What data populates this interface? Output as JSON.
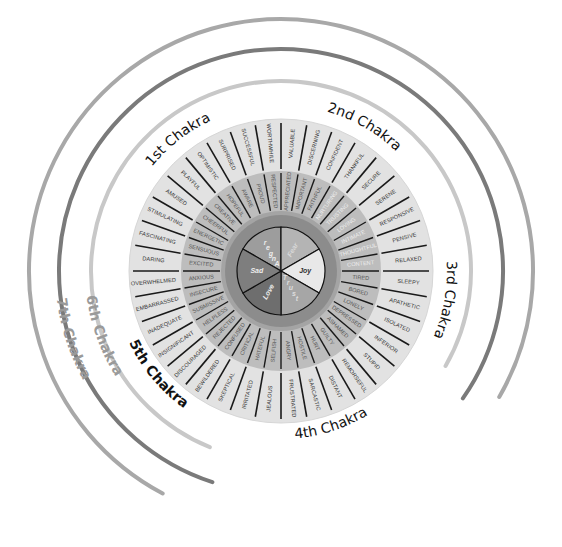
{
  "diagram": {
    "type": "emotion-wheel",
    "center": {
      "x": 281,
      "y": 271
    },
    "colors": {
      "background": "#ffffff",
      "outer_ring_fill": "#e2e2e2",
      "middle_ring_fill": "#bdbdbd",
      "core_fill": "#8c8c8c",
      "spoke": "#1a1a1a",
      "arc_light": "#c8c8c8",
      "arc_dark": "#7a7a7a",
      "arc_mid": "#a8a8a8"
    },
    "core_emotions": [
      {
        "label": "Anger",
        "fill": "#9d9d9d",
        "text_color": "#eeeeee",
        "vertical": true
      },
      {
        "label": "Fear",
        "fill": "#b4b4b4",
        "text_color": "#d8d8d8"
      },
      {
        "label": "Joy",
        "fill": "#e8e8e8",
        "text_color": "#333333"
      },
      {
        "label": "Trust",
        "fill": "#a6a6a6",
        "text_color": "#dddddd",
        "vertical": true
      },
      {
        "label": "Love",
        "fill": "#6e6e6e",
        "text_color": "#eeeeee"
      },
      {
        "label": "Sad",
        "fill": "#7e7e7e",
        "text_color": "#eeeeee"
      }
    ],
    "middle_ring_words": [
      "TIRED",
      "BORED",
      "LONELY",
      "DEPRESSED",
      "ASHAMED",
      "GUILTY",
      "HURT",
      "HOSTILE",
      "ANGRY",
      "SELFISH",
      "HATEFUL",
      "CRITICAL",
      "CONFUSED",
      "REJECTED",
      "HELPLESS",
      "SUBMISSIVE",
      "INSECURE",
      "ANXIOUS",
      "EXCITED",
      "SENSUOUS",
      "ENERGETIC",
      "CHEERFUL",
      "CREATIVE",
      "HOPEFUL",
      "AWARE",
      "PROUD",
      "RESPECTED",
      "APPRECIATED",
      "IMPORTANT",
      "FAITHFUL",
      "NURTURING",
      "TRUSTING",
      "LOVING",
      "INTIMATE",
      "THOUGHTFUL",
      "CONTENT"
    ],
    "outer_ring_words": [
      "SLEEPY",
      "APATHETIC",
      "ISOLATED",
      "INFERIOR",
      "STUPID",
      "REMORSEFUL",
      "DISTANT",
      "SARCASTIC",
      "FRUSTRATED",
      "JEALOUS",
      "IRRITATED",
      "SKEPTICAL",
      "BEWILDERED",
      "DISCOURAGED",
      "INSIGNIFICANT",
      "INADEQUATE",
      "EMBARRASSED",
      "OVERWHELMED",
      "DARING",
      "FASCINATING",
      "STIMULATING",
      "AMUSED",
      "PLAYFUL",
      "OPTIMISTIC",
      "SURPRISED",
      "SUCCESSFUL",
      "WORTHWHILE",
      "VALUABLE",
      "DISCERNING",
      "CONFIDENT",
      "THANKFUL",
      "SECURE",
      "SERENE",
      "RESPONSIVE",
      "PENSIVE",
      "RELAXED"
    ],
    "chakra_labels": [
      {
        "label": "1st Chakra",
        "angle": -125
      },
      {
        "label": "2nd Chakra",
        "angle": -62
      },
      {
        "label": "3rd Chakra",
        "angle": 8
      },
      {
        "label": "4th Chakra",
        "angle": 70
      },
      {
        "label": "5th Chakra",
        "angle": 140
      },
      {
        "label": "6th Chakra",
        "angle": 172
      },
      {
        "label": "7th Chakra",
        "angle": 170
      }
    ],
    "arcs": [
      {
        "name": "arc-inner",
        "r": 190,
        "start": 112,
        "end": 390,
        "color": "#c8c8c8"
      },
      {
        "name": "arc-middle",
        "r": 222,
        "start": 108,
        "end": 395,
        "color": "#7a7a7a"
      },
      {
        "name": "arc-outer",
        "r": 252,
        "start": 118,
        "end": 390,
        "color": "#a8a8a8"
      }
    ]
  }
}
